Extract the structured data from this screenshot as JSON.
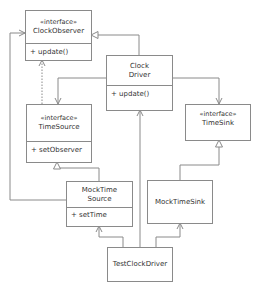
{
  "diagram": {
    "type": "uml-class-diagram",
    "line_color": "#8a8a8a",
    "text_color": "#333333",
    "classes": {
      "clock_observer": {
        "stereotype": "«interface»",
        "name": "ClockObserver",
        "operations": [
          "+ update()"
        ]
      },
      "clock_driver": {
        "name_line1": "Clock",
        "name_line2": "Driver",
        "operations": [
          "+ update()"
        ]
      },
      "time_source": {
        "stereotype": "«interface»",
        "name": "TimeSource",
        "operations": [
          "+ setObserver"
        ]
      },
      "time_sink": {
        "stereotype": "«interface»",
        "name": "TimeSink"
      },
      "mock_time_source": {
        "name_line1": "MockTime",
        "name_line2": "Source",
        "operations": [
          "+ setTime"
        ]
      },
      "mock_time_sink": {
        "name": "MockTimeSink"
      },
      "test_clock_driver": {
        "name": "TestClockDriver"
      }
    },
    "relationships": [
      {
        "from": "ClockDriver",
        "to": "ClockObserver",
        "kind": "realization"
      },
      {
        "from": "ClockDriver",
        "to": "TimeSource",
        "kind": "association"
      },
      {
        "from": "ClockDriver",
        "to": "TimeSink",
        "kind": "association"
      },
      {
        "from": "TimeSource",
        "to": "ClockObserver",
        "kind": "dependency"
      },
      {
        "from": "MockTimeSource",
        "to": "TimeSource",
        "kind": "realization"
      },
      {
        "from": "MockTimeSource",
        "to": "ClockObserver",
        "kind": "association"
      },
      {
        "from": "MockTimeSink",
        "to": "TimeSink",
        "kind": "realization"
      },
      {
        "from": "TestClockDriver",
        "to": "MockTimeSource",
        "kind": "association"
      },
      {
        "from": "TestClockDriver",
        "to": "ClockDriver",
        "kind": "association"
      },
      {
        "from": "TestClockDriver",
        "to": "MockTimeSink",
        "kind": "association"
      }
    ]
  }
}
